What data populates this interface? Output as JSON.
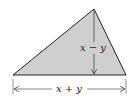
{
  "diagram": {
    "shape": "triangle",
    "fill_color": "#cfcfcf",
    "stroke_color": "#222222",
    "vertices": {
      "left": [
        13,
        75
      ],
      "right": [
        126,
        75
      ],
      "top": [
        94,
        9
      ]
    },
    "height_label": "x − y",
    "base_label": "x + y"
  }
}
